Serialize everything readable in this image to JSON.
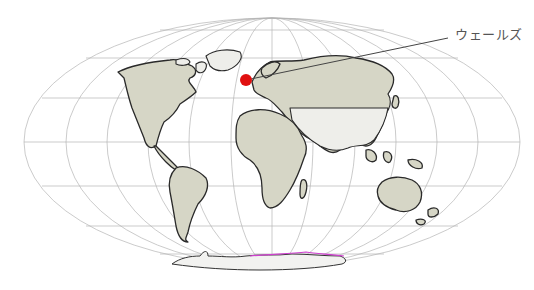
{
  "map": {
    "projection": "Mollweide",
    "highlight": {
      "label": "ウェールズ",
      "marker_color": "#e01010"
    },
    "colors": {
      "land": "#d6d6c6",
      "grid": "#b5b5b5",
      "antarctica_edge": "#d040d0"
    }
  }
}
